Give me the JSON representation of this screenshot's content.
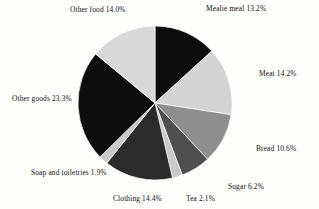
{
  "chart_data": {
    "type": "pie",
    "title": "",
    "subtitle": "",
    "xlabel": "",
    "ylabel": "",
    "legend_position": "none",
    "grid": false,
    "labels_position": "outside",
    "units": "percent",
    "start_angle_deg": 0,
    "direction": "clockwise",
    "center": [
      155,
      103
    ],
    "radius": 77,
    "categories": [
      "Mealie meal",
      "Meat",
      "Bread",
      "Sugar",
      "Tea",
      "Clothing",
      "Soap and toiletries",
      "Other goods",
      "Other food"
    ],
    "values": [
      13.2,
      14.2,
      10.6,
      6.2,
      2.1,
      14.4,
      1.9,
      23.3,
      14.0
    ],
    "colors": [
      "#0d0d0d",
      "#d4d4d4",
      "#8e8e8e",
      "#4f4f4f",
      "#c9c9c9",
      "#2b2b2b",
      "#c9c9c9",
      "#0d0d0d",
      "#d8d8d8"
    ],
    "slices": [
      {
        "label": "Mealie meal",
        "value": 13.2,
        "display": "Mealie meal 13.2%",
        "color": "#0d0d0d"
      },
      {
        "label": "Meat",
        "value": 14.2,
        "display": "Meat 14.2%",
        "color": "#d4d4d4"
      },
      {
        "label": "Bread",
        "value": 10.6,
        "display": "Bread 10.6%",
        "color": "#8e8e8e"
      },
      {
        "label": "Sugar",
        "value": 6.2,
        "display": "Sugar 6.2%",
        "color": "#4f4f4f"
      },
      {
        "label": "Tea",
        "value": 2.1,
        "display": "Tea 2.1%",
        "color": "#c9c9c9"
      },
      {
        "label": "Clothing",
        "value": 14.4,
        "display": "Clothing 14.4%",
        "color": "#2b2b2b"
      },
      {
        "label": "Soap and toiletries",
        "value": 1.9,
        "display": "Soap and toiletries 1.9%",
        "color": "#c9c9c9"
      },
      {
        "label": "Other goods",
        "value": 23.3,
        "display": "Other goods 23.3%",
        "color": "#0d0d0d"
      },
      {
        "label": "Other food",
        "value": 14.0,
        "display": "Other food 14.0%",
        "color": "#d8d8d8"
      }
    ]
  },
  "labels": {
    "mealie_meal": "Mealie meal 13.2%",
    "meat": "Meat 14.2%",
    "bread": "Bread 10.6%",
    "sugar": "Sugar 6.2%",
    "tea": "Tea 2.1%",
    "clothing": "Clothing 14.4%",
    "soap": "Soap and toiletries 1.9%",
    "other_goods": "Other goods 23.3%",
    "other_food": "Other food 14.0%"
  }
}
